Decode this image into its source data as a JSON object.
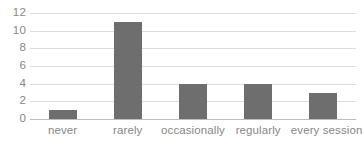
{
  "chart_data": {
    "type": "bar",
    "title": "",
    "subtitle": "",
    "xlabel": "",
    "ylabel": "",
    "categories": [
      "never",
      "rarely",
      "occasionally",
      "regularly",
      "every session"
    ],
    "values": [
      1,
      11,
      4,
      4,
      3
    ],
    "ylim": [
      0,
      12
    ],
    "ytick_labels": [
      "0",
      "2",
      "4",
      "6",
      "8",
      "10",
      "12"
    ],
    "ytick_values": [
      0,
      2,
      4,
      6,
      8,
      10,
      12
    ],
    "grid": "horizontal",
    "legend": "none",
    "orientation": "vertical",
    "series": [
      {
        "name": "",
        "values": [
          1,
          11,
          4,
          4,
          3
        ]
      }
    ]
  },
  "style": {
    "bar_color": "#6e6e6e",
    "gridline_color": "#dcdcdc",
    "axis_line_color": "#bdbdbd",
    "tick_label_color": "#878787",
    "background_color": "#ffffff"
  }
}
